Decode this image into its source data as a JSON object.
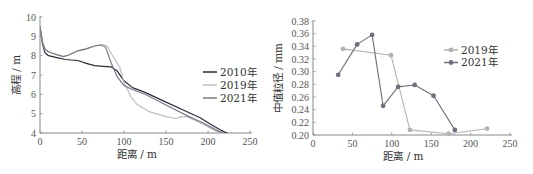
{
  "chart_data": [
    {
      "type": "line",
      "title": "",
      "xlabel": "距离 / m",
      "ylabel": "高程 / m",
      "xlim": [
        0,
        250
      ],
      "ylim": [
        4,
        10
      ],
      "x_ticks": [
        "0",
        "50",
        "100",
        "150",
        "200",
        "250"
      ],
      "y_ticks": [
        "4",
        "5",
        "6",
        "7",
        "8",
        "9",
        "10"
      ],
      "legend_position": "right",
      "grid": false,
      "series": [
        {
          "name": "2010年",
          "color": "#2b2b3a",
          "x": [
            0,
            3,
            6,
            10,
            20,
            30,
            45,
            55,
            65,
            75,
            85,
            92,
            100,
            110,
            125,
            150,
            175,
            190,
            205,
            215,
            225
          ],
          "y": [
            9.5,
            8.6,
            8.15,
            8.0,
            7.9,
            7.8,
            7.75,
            7.6,
            7.48,
            7.45,
            7.42,
            7.2,
            6.7,
            6.35,
            6.1,
            5.6,
            5.1,
            4.8,
            4.4,
            4.15,
            3.95
          ]
        },
        {
          "name": "2019年",
          "color": "#bdbdbd",
          "x": [
            0,
            3,
            6,
            10,
            20,
            28,
            35,
            45,
            55,
            65,
            75,
            80,
            85,
            95,
            100,
            108,
            115,
            130,
            150,
            162,
            168,
            175,
            190,
            205,
            215
          ],
          "y": [
            9.5,
            8.7,
            8.3,
            8.2,
            8.05,
            7.95,
            8.05,
            8.25,
            8.35,
            8.5,
            8.58,
            8.5,
            8.1,
            7.4,
            6.6,
            5.9,
            5.5,
            5.1,
            4.85,
            4.75,
            4.85,
            4.85,
            4.55,
            4.2,
            4.0
          ]
        },
        {
          "name": "2021年",
          "color": "#7a7a88",
          "x": [
            0,
            3,
            6,
            10,
            20,
            28,
            35,
            45,
            55,
            65,
            72,
            78,
            85,
            92,
            100,
            110,
            125,
            150,
            175,
            195,
            210,
            220
          ],
          "y": [
            9.5,
            8.7,
            8.35,
            8.2,
            8.05,
            7.95,
            8.05,
            8.25,
            8.35,
            8.5,
            8.55,
            8.45,
            7.6,
            6.9,
            6.45,
            6.25,
            6.0,
            5.45,
            4.9,
            4.5,
            4.15,
            3.95
          ]
        }
      ]
    },
    {
      "type": "line",
      "title": "",
      "xlabel": "距离 / m",
      "ylabel": "中值粒径 / mm",
      "xlim": [
        0,
        250
      ],
      "ylim": [
        0.2,
        0.38
      ],
      "x_ticks": [
        "0",
        "50",
        "100",
        "150",
        "200",
        "250"
      ],
      "y_ticks": [
        "0.20",
        "0.22",
        "0.24",
        "0.26",
        "0.28",
        "0.30",
        "0.32",
        "0.34",
        "0.36",
        "0.38"
      ],
      "legend_position": "right",
      "grid": false,
      "markers": true,
      "series": [
        {
          "name": "2019年",
          "color": "#b3b3b3",
          "x": [
            38,
            99,
            123,
            172,
            221
          ],
          "y": [
            0.336,
            0.326,
            0.208,
            0.202,
            0.21
          ]
        },
        {
          "name": "2021年",
          "color": "#6e6e7c",
          "x": [
            32,
            56,
            75,
            89,
            108,
            129,
            153,
            180
          ],
          "y": [
            0.295,
            0.343,
            0.358,
            0.246,
            0.276,
            0.279,
            0.262,
            0.208
          ]
        }
      ]
    }
  ]
}
